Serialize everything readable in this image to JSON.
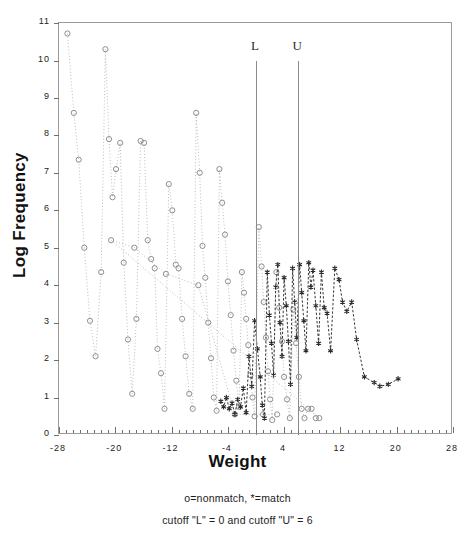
{
  "figure": {
    "title_clipped": "",
    "xlabel": "Weight",
    "ylabel": "Log Frequency",
    "caption_line1": "o=nonmatch, *=match",
    "caption_line2": "cutoff \"L\" = 0 and cutoff \"U\" = 6"
  },
  "cutoffs": {
    "lower": {
      "label": "L",
      "value": 0
    },
    "upper": {
      "label": "U",
      "value": 6
    }
  },
  "colors": {
    "nonmatch": "#8f8f8f",
    "match": "#2b2b2b",
    "frame": "#9a9a9a",
    "cutline": "#8c8c8c",
    "background": "#ffffff"
  },
  "chart_data": {
    "type": "scatter",
    "title": "",
    "xlabel": "Weight",
    "ylabel": "Log Frequency",
    "xlim": [
      -28,
      28
    ],
    "ylim": [
      0,
      11
    ],
    "xticks": [
      -28,
      -20,
      -12,
      -4,
      4,
      12,
      20,
      28
    ],
    "yticks": [
      0,
      1,
      2,
      3,
      4,
      5,
      6,
      7,
      8,
      9,
      10,
      11
    ],
    "xtick_labels": [
      "-28",
      "-20",
      "-12",
      "-4",
      "4",
      "12",
      "20",
      "28"
    ],
    "ytick_labels": [
      "0",
      "1",
      "2",
      "3",
      "4",
      "5",
      "6",
      "7",
      "8",
      "9",
      "10",
      "11"
    ],
    "minor_xticks_per_interval": 8,
    "grid": false,
    "legend_position": "below-plot",
    "annotations": [
      {
        "text": "L",
        "x": 0,
        "type": "vertical-line",
        "y_top": 10.0,
        "y_bottom": 0
      },
      {
        "text": "U",
        "x": 6,
        "type": "vertical-line",
        "y_top": 10.0,
        "y_bottom": 0
      }
    ],
    "series": [
      {
        "name": "nonmatch",
        "marker": "o",
        "linestyle": "dotted",
        "color": "#8f8f8f",
        "points": [
          [
            -26.8,
            10.72
          ],
          [
            -25.9,
            8.6
          ],
          [
            -25.2,
            7.35
          ],
          [
            -24.4,
            5.0
          ],
          [
            -23.6,
            3.05
          ],
          [
            -22.8,
            2.1
          ],
          [
            -22.0,
            4.35
          ],
          [
            -21.4,
            10.3
          ],
          [
            -20.9,
            7.9
          ],
          [
            -20.4,
            6.35
          ],
          [
            -19.9,
            7.1
          ],
          [
            -19.3,
            7.8
          ],
          [
            -18.8,
            4.6
          ],
          [
            -18.2,
            2.55
          ],
          [
            -17.6,
            1.1
          ],
          [
            -17.0,
            3.1
          ],
          [
            -16.4,
            7.85
          ],
          [
            -15.9,
            7.8
          ],
          [
            -15.4,
            5.2
          ],
          [
            -14.9,
            4.7
          ],
          [
            -14.4,
            4.45
          ],
          [
            -14.0,
            2.3
          ],
          [
            -13.5,
            1.65
          ],
          [
            -13.0,
            0.7
          ],
          [
            -12.4,
            6.7
          ],
          [
            -11.9,
            6.0
          ],
          [
            -11.4,
            4.55
          ],
          [
            -11.0,
            4.45
          ],
          [
            -10.5,
            3.1
          ],
          [
            -10.0,
            2.1
          ],
          [
            -9.5,
            1.1
          ],
          [
            -9.0,
            0.7
          ],
          [
            -8.5,
            8.6
          ],
          [
            -8.0,
            7.0
          ],
          [
            -7.6,
            5.05
          ],
          [
            -7.2,
            4.2
          ],
          [
            -6.8,
            3.0
          ],
          [
            -6.4,
            2.05
          ],
          [
            -6.0,
            1.0
          ],
          [
            -5.6,
            0.65
          ],
          [
            -5.2,
            7.1
          ],
          [
            -4.8,
            6.2
          ],
          [
            -4.4,
            5.35
          ],
          [
            -4.0,
            4.1
          ],
          [
            -3.6,
            3.2
          ],
          [
            -3.2,
            2.25
          ],
          [
            -2.8,
            1.45
          ],
          [
            -2.4,
            0.75
          ],
          [
            -2.0,
            4.35
          ],
          [
            -1.7,
            3.8
          ],
          [
            -1.4,
            3.1
          ],
          [
            -1.1,
            2.4
          ],
          [
            -0.8,
            1.6
          ],
          [
            -0.5,
            1.0
          ],
          [
            -0.2,
            0.5
          ],
          [
            0.4,
            5.55
          ],
          [
            0.8,
            4.5
          ],
          [
            1.1,
            3.55
          ],
          [
            1.4,
            2.6
          ],
          [
            1.7,
            1.7
          ],
          [
            2.0,
            0.95
          ],
          [
            2.3,
            0.4
          ],
          [
            2.9,
            4.35
          ],
          [
            3.3,
            3.4
          ],
          [
            3.7,
            2.5
          ],
          [
            4.0,
            1.55
          ],
          [
            4.4,
            0.95
          ],
          [
            4.8,
            0.45
          ],
          [
            5.3,
            3.35
          ],
          [
            5.7,
            2.45
          ],
          [
            6.1,
            1.55
          ],
          [
            6.5,
            0.7
          ],
          [
            6.9,
            0.45
          ],
          [
            7.4,
            0.7
          ],
          [
            7.9,
            0.7
          ],
          [
            8.5,
            0.45
          ],
          [
            9.0,
            0.45
          ],
          [
            -20.6,
            5.2
          ],
          [
            -17.3,
            5.0
          ],
          [
            -12.8,
            4.3
          ],
          [
            -8.2,
            4.0
          ],
          [
            -3.0,
            0.55
          ],
          [
            1.0,
            0.55
          ],
          [
            3.0,
            0.55
          ]
        ]
      },
      {
        "name": "match",
        "marker": "*",
        "linestyle": "dashed",
        "color": "#2b2b2b",
        "points": [
          [
            -5.0,
            0.9
          ],
          [
            -4.6,
            0.75
          ],
          [
            -4.2,
            1.0
          ],
          [
            -3.8,
            0.7
          ],
          [
            -3.4,
            0.85
          ],
          [
            -3.0,
            0.55
          ],
          [
            -2.6,
            0.95
          ],
          [
            -2.2,
            0.75
          ],
          [
            -1.8,
            1.25
          ],
          [
            -1.4,
            0.6
          ],
          [
            -1.0,
            2.1
          ],
          [
            -0.6,
            1.3
          ],
          [
            -0.2,
            3.05
          ],
          [
            0.2,
            2.3
          ],
          [
            0.6,
            1.55
          ],
          [
            0.9,
            0.8
          ],
          [
            1.2,
            0.45
          ],
          [
            1.6,
            4.35
          ],
          [
            1.9,
            3.2
          ],
          [
            2.2,
            2.45
          ],
          [
            2.5,
            1.6
          ],
          [
            2.8,
            3.95
          ],
          [
            3.1,
            4.55
          ],
          [
            3.4,
            3.0
          ],
          [
            3.7,
            2.1
          ],
          [
            4.0,
            4.2
          ],
          [
            4.3,
            3.45
          ],
          [
            4.6,
            2.5
          ],
          [
            4.9,
            1.35
          ],
          [
            5.2,
            4.45
          ],
          [
            5.5,
            3.55
          ],
          [
            5.8,
            2.6
          ],
          [
            6.2,
            4.55
          ],
          [
            6.5,
            3.8
          ],
          [
            6.8,
            3.05
          ],
          [
            7.1,
            2.25
          ],
          [
            7.5,
            4.6
          ],
          [
            7.8,
            3.95
          ],
          [
            8.1,
            4.4
          ],
          [
            8.5,
            3.45
          ],
          [
            8.9,
            2.45
          ],
          [
            9.3,
            4.35
          ],
          [
            9.7,
            3.4
          ],
          [
            10.1,
            3.25
          ],
          [
            10.6,
            2.25
          ],
          [
            11.2,
            4.45
          ],
          [
            11.8,
            4.15
          ],
          [
            12.3,
            3.55
          ],
          [
            12.9,
            3.3
          ],
          [
            13.6,
            3.55
          ],
          [
            14.3,
            2.55
          ],
          [
            15.4,
            1.55
          ],
          [
            16.8,
            1.4
          ],
          [
            17.6,
            1.3
          ],
          [
            18.8,
            1.35
          ],
          [
            20.2,
            1.5
          ]
        ]
      }
    ]
  }
}
